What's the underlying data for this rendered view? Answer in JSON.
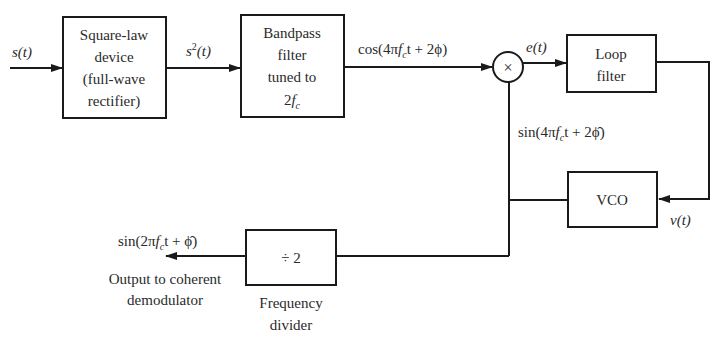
{
  "diagram": {
    "blocks": {
      "square_law": {
        "lines": [
          "Square-law",
          "device",
          "(full-wave",
          "rectifier)"
        ]
      },
      "bandpass": {
        "lines": [
          "Bandpass",
          "filter",
          "tuned to"
        ],
        "last_line": {
          "num": "2",
          "f": "f",
          "sub": "c"
        }
      },
      "multiplier": {
        "symbol": "×"
      },
      "loop_filter": {
        "lines": [
          "Loop",
          "filter"
        ]
      },
      "vco": {
        "label": "VCO"
      },
      "divider": {
        "label": "÷ 2",
        "caption": [
          "Frequency",
          "divider"
        ]
      }
    },
    "signals": {
      "input": "s(t)",
      "squared": {
        "base": "s",
        "exp": "2",
        "arg": "(t)"
      },
      "bpf_out": {
        "pre": "cos(4π",
        "f": "f",
        "sub": "c",
        "post": "t + 2ϕ)"
      },
      "error": "e(t)",
      "vco_out": {
        "pre": "sin(4π",
        "f": "f",
        "sub": "c",
        "post": "t + 2",
        "phi": "ϕ̂",
        "close": ")"
      },
      "control": "v(t)",
      "output": {
        "pre": "sin(2π",
        "f": "f",
        "sub": "c",
        "post": "t + ",
        "phi": "ϕ̂",
        "close": ")"
      },
      "output_caption": [
        "Output to coherent",
        "demodulator"
      ]
    }
  }
}
